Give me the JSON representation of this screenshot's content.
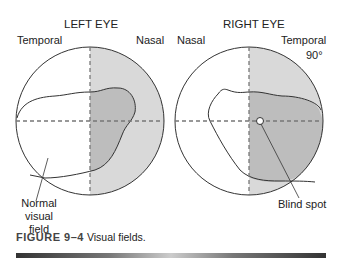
{
  "left_eye": {
    "title": "LEFT EYE",
    "label_left": "Temporal",
    "label_right": "Nasal",
    "callout": [
      "Normal",
      "visual",
      "field"
    ]
  },
  "right_eye": {
    "title": "RIGHT EYE",
    "label_left": "Nasal",
    "label_right": "Temporal",
    "degree_label": "90°",
    "callout": "Blind spot"
  },
  "caption": {
    "number": "FIGURE 9–4",
    "text": "Visual fields."
  },
  "colors": {
    "shade_light": "#d9d9d9",
    "shade_dark": "#bdbdbd",
    "line": "#333333",
    "dash": "#777777"
  }
}
